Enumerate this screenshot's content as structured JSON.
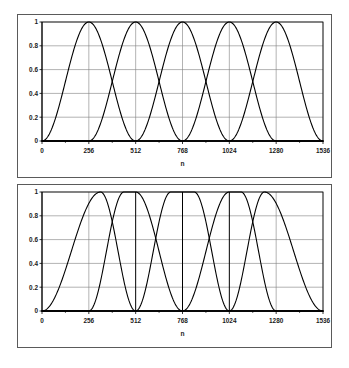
{
  "figure": {
    "panel_count": 2,
    "background_color": "#ffffff",
    "frame_color": "#5a5a5a"
  },
  "chart_data": [
    {
      "id": "top-panel",
      "type": "line",
      "title": "",
      "subtitle": "",
      "xlabel": "n",
      "ylabel": "",
      "xlim": [
        0,
        1536
      ],
      "ylim": [
        0,
        1
      ],
      "grid": true,
      "grid_color": "#808080",
      "legend": "none",
      "curve_color": "#000000",
      "curve_width": 1.1,
      "xticks": [
        0,
        256,
        512,
        768,
        1024,
        1280,
        1536
      ],
      "xtick_labels": [
        "0",
        "256",
        "512",
        "768",
        "1024",
        "1280",
        "1536"
      ],
      "yticks": [
        0,
        0.2,
        0.4,
        0.6,
        0.8,
        1
      ],
      "ytick_labels": [
        "0",
        "0.2",
        "0.4",
        "0.6",
        "0.8",
        "1"
      ],
      "description": "Five identical overlapping raised-cosine (MLT) windows of equal length 512, hopping by 256 samples; adjacent windows cross at about 0.707.",
      "series": [
        {
          "name": "window-1",
          "type": "mlt",
          "start": 0,
          "end": 512,
          "rise": 256,
          "fall": 256,
          "flat_from": 192,
          "flat_to": 320
        },
        {
          "name": "window-2",
          "type": "mlt",
          "start": 256,
          "end": 768,
          "rise": 256,
          "fall": 256,
          "flat_from": 448,
          "flat_to": 576
        },
        {
          "name": "window-3",
          "type": "mlt",
          "start": 512,
          "end": 1024,
          "rise": 256,
          "fall": 256,
          "flat_from": 704,
          "flat_to": 832
        },
        {
          "name": "window-4",
          "type": "mlt",
          "start": 768,
          "end": 1280,
          "rise": 256,
          "fall": 256,
          "flat_from": 960,
          "flat_to": 1088
        },
        {
          "name": "window-5",
          "type": "mlt",
          "start": 1024,
          "end": 1536,
          "rise": 256,
          "fall": 256,
          "flat_from": 1216,
          "flat_to": 1344
        }
      ],
      "crossing_value": 0.707
    },
    {
      "id": "bottom-panel",
      "type": "line",
      "title": "",
      "subtitle": "",
      "xlabel": "n",
      "ylabel": "",
      "xlim": [
        0,
        1536
      ],
      "ylim": [
        0,
        1
      ],
      "grid": true,
      "grid_color": "#808080",
      "legend": "none",
      "curve_color": "#000000",
      "curve_width": 1.1,
      "xticks": [
        0,
        256,
        512,
        768,
        1024,
        1280,
        1536
      ],
      "xtick_labels": [
        "0",
        "256",
        "512",
        "768",
        "1024",
        "1280",
        "1536"
      ],
      "yticks": [
        0,
        0.2,
        0.4,
        0.6,
        0.8,
        1
      ],
      "ytick_labels": [
        "0",
        "0.2",
        "0.4",
        "0.6",
        "0.8",
        "1"
      ],
      "description": "Window-switching sequence: long start window, short transition windows that reach zero exactly at 512, 768 and 1024, and a long stop window; adjacent windows still cross near 0.707.",
      "series": [
        {
          "name": "window-1",
          "type": "mlt",
          "start": 0,
          "end": 512,
          "rise": 320,
          "fall": 192,
          "flat_from": 200,
          "flat_to": 350
        },
        {
          "name": "window-2",
          "type": "mlt",
          "start": 256,
          "end": 768,
          "rise": 192,
          "fall": 256,
          "flat_from": 400,
          "flat_to": 560
        },
        {
          "name": "window-3",
          "type": "mlt",
          "start": 512,
          "end": 1024,
          "rise": 192,
          "fall": 192,
          "flat_from": 660,
          "flat_to": 860
        },
        {
          "name": "window-4",
          "type": "mlt",
          "start": 768,
          "end": 1280,
          "rise": 256,
          "fall": 192,
          "flat_from": 960,
          "flat_to": 1120
        },
        {
          "name": "window-5",
          "type": "mlt",
          "start": 1024,
          "end": 1536,
          "rise": 192,
          "fall": 320,
          "flat_from": 1180,
          "flat_to": 1340
        }
      ],
      "emphasized_gridlines": [
        512,
        768,
        1024
      ],
      "crossing_value": 0.707
    }
  ]
}
